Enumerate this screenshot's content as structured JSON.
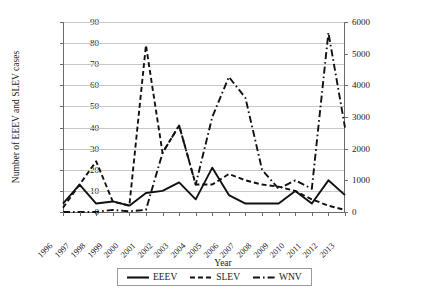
{
  "chart_data": {
    "type": "line",
    "title": "",
    "xlabel": "Year",
    "ylabel": "Number of EEEV and SLEV cases",
    "ylabel_secondary": "Number of WNV cases",
    "categories": [
      "1996",
      "1997",
      "1998",
      "1999",
      "2000",
      "2001",
      "2002",
      "2003",
      "2004",
      "2005",
      "2006",
      "2007",
      "2008",
      "2009",
      "2010",
      "2011",
      "2012",
      "2013"
    ],
    "ylim": [
      0,
      90
    ],
    "yticks": [
      0,
      10,
      20,
      30,
      40,
      50,
      60,
      70,
      80,
      90
    ],
    "ylim_secondary": [
      0,
      6000
    ],
    "yticks_secondary": [
      0,
      1000,
      2000,
      3000,
      4000,
      5000,
      6000
    ],
    "grid": true,
    "legend_position": "bottom",
    "series": [
      {
        "name": "EEEV",
        "axis": "left",
        "style": "solid",
        "values": [
          4,
          13,
          4,
          5,
          3,
          9,
          10,
          14,
          6,
          21,
          8,
          4,
          4,
          4,
          10,
          4,
          15,
          8
        ]
      },
      {
        "name": "SLEV",
        "axis": "left",
        "style": "dashed",
        "values": [
          2,
          13,
          24,
          5,
          3,
          79,
          28,
          41,
          13,
          13,
          18,
          15,
          13,
          12,
          10,
          6,
          3,
          1
        ]
      },
      {
        "name": "WNV",
        "axis": "right",
        "style": "dash-dot",
        "values": [
          0,
          0,
          0,
          62,
          21,
          66,
          4156,
          9862,
          2539,
          3000,
          4269,
          3630,
          1356,
          720,
          1021,
          712,
          5674,
          2469
        ]
      }
    ],
    "wnv_plotted_left_equivalent": [
      0,
      0,
      0,
      1,
      0.3,
      1,
      28,
      41,
      13,
      45,
      64,
      54,
      20,
      11,
      15,
      11,
      85,
      40
    ]
  },
  "legend": {
    "items": [
      {
        "label": "EEEV",
        "icon": "solid-line-icon"
      },
      {
        "label": "SLEV",
        "icon": "dashed-line-icon"
      },
      {
        "label": "WNV",
        "icon": "dash-dot-line-icon"
      }
    ]
  }
}
